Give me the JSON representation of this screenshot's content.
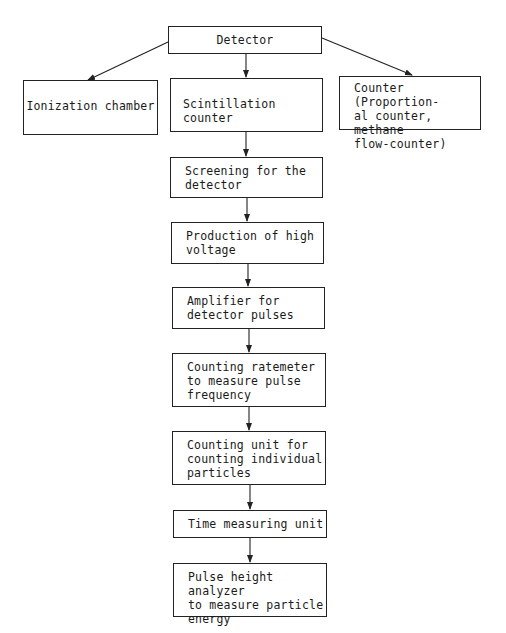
{
  "diagram": {
    "type": "flowchart",
    "root": {
      "id": "detector",
      "label": "Detector"
    },
    "branches": [
      {
        "id": "ionization",
        "label": "Ionization chamber"
      },
      {
        "id": "scintillation",
        "label": "Scintillation counter"
      },
      {
        "id": "counter",
        "label": "Counter (Proportion-\nal counter, methane\nflow-counter)"
      }
    ],
    "chain": [
      {
        "id": "screening",
        "label": "Screening for the\ndetector"
      },
      {
        "id": "high-voltage",
        "label": "Production of high\nvoltage"
      },
      {
        "id": "amplifier",
        "label": "Amplifier for\ndetector pulses"
      },
      {
        "id": "ratemeter",
        "label": "Counting ratemeter\nto measure pulse\nfrequency"
      },
      {
        "id": "counting-unit",
        "label": "Counting unit for\ncounting individual\nparticles"
      },
      {
        "id": "time-unit",
        "label": "Time measuring unit"
      },
      {
        "id": "pulse-analyzer",
        "label": "Pulse height analyzer\nto measure particle\nenergy"
      }
    ],
    "edges": [
      [
        "detector",
        "ionization"
      ],
      [
        "detector",
        "scintillation"
      ],
      [
        "detector",
        "counter"
      ],
      [
        "scintillation",
        "screening"
      ],
      [
        "screening",
        "high-voltage"
      ],
      [
        "high-voltage",
        "amplifier"
      ],
      [
        "amplifier",
        "ratemeter"
      ],
      [
        "ratemeter",
        "counting-unit"
      ],
      [
        "counting-unit",
        "time-unit"
      ],
      [
        "time-unit",
        "pulse-analyzer"
      ]
    ]
  },
  "colors": {
    "line": "#222222",
    "background": "#ffffff"
  }
}
